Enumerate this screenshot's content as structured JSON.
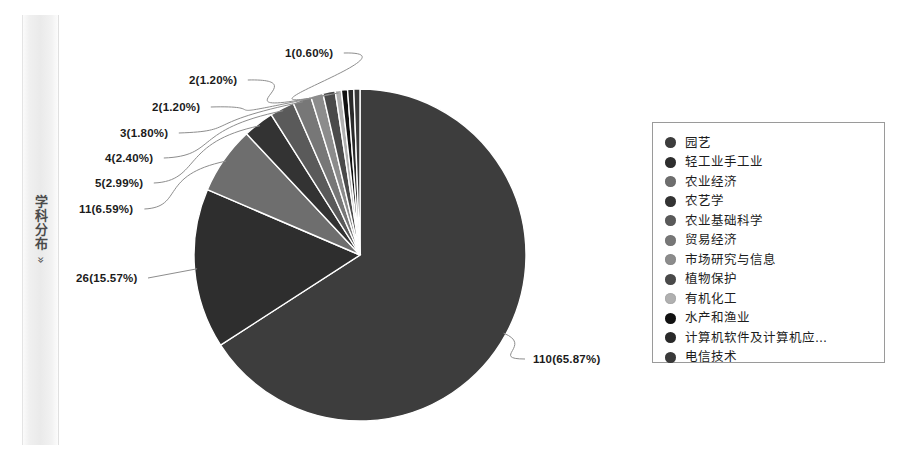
{
  "sidebar": {
    "label": "学科分布",
    "chevron": "»",
    "chevron_icon": "double-chevron-right-icon"
  },
  "legend": {
    "position": "right",
    "items": [
      {
        "label": "园艺",
        "color": "#3d3d3d"
      },
      {
        "label": "轻工业手工业",
        "color": "#2e2e2e"
      },
      {
        "label": "农业经济",
        "color": "#6e6e6e"
      },
      {
        "label": "农艺学",
        "color": "#333333"
      },
      {
        "label": "农业基础科学",
        "color": "#5a5a5a"
      },
      {
        "label": "贸易经济",
        "color": "#777777"
      },
      {
        "label": "市场研究与信息",
        "color": "#8c8c8c"
      },
      {
        "label": "植物保护",
        "color": "#4a4a4a"
      },
      {
        "label": "有机化工",
        "color": "#b0b0b0"
      },
      {
        "label": "水产和渔业",
        "color": "#111111"
      },
      {
        "label": "计算机软件及计算机应...",
        "color": "#2a2a2a"
      },
      {
        "label": "电信技术",
        "color": "#3a3a3a"
      }
    ]
  },
  "chart_data": {
    "type": "pie",
    "title": "",
    "total": 167,
    "legend_position": "right",
    "labels": [
      "园艺",
      "轻工业手工业",
      "农业经济",
      "农艺学",
      "农业基础科学",
      "贸易经济",
      "市场研究与信息",
      "植物保护",
      "有机化工",
      "水产和渔业",
      "计算机软件及计算机应...",
      "电信技术"
    ],
    "values": [
      110,
      26,
      11,
      5,
      4,
      3,
      2,
      2,
      1,
      1,
      1,
      1
    ],
    "percents": [
      65.87,
      15.57,
      6.59,
      2.99,
      2.4,
      1.8,
      1.2,
      1.2,
      0.6,
      0.6,
      0.6,
      0.6
    ],
    "colors": [
      "#3d3d3d",
      "#2e2e2e",
      "#6e6e6e",
      "#333333",
      "#5a5a5a",
      "#777777",
      "#8c8c8c",
      "#4a4a4a",
      "#b0b0b0",
      "#111111",
      "#2a2a2a",
      "#3a3a3a"
    ],
    "annotations": [
      {
        "text": "110(65.87%)",
        "x": 533,
        "y": 353,
        "value": 110,
        "percent": 65.87
      },
      {
        "text": "26(15.57%)",
        "x": 76,
        "y": 272,
        "value": 26,
        "percent": 15.57
      },
      {
        "text": "11(6.59%)",
        "x": 79,
        "y": 203,
        "value": 11,
        "percent": 6.59
      },
      {
        "text": "5(2.99%)",
        "x": 95,
        "y": 177,
        "value": 5,
        "percent": 2.99
      },
      {
        "text": "4(2.40%)",
        "x": 105,
        "y": 152,
        "value": 4,
        "percent": 2.4
      },
      {
        "text": "3(1.80%)",
        "x": 120,
        "y": 127,
        "value": 3,
        "percent": 1.8
      },
      {
        "text": "2(1.20%)",
        "x": 152,
        "y": 101,
        "value": 2,
        "percent": 1.2
      },
      {
        "text": "2(1.20%)",
        "x": 189,
        "y": 74,
        "value": 2,
        "percent": 1.2
      },
      {
        "text": "1(0.60%)",
        "x": 285,
        "y": 47,
        "value": 1,
        "percent": 0.6
      }
    ]
  }
}
